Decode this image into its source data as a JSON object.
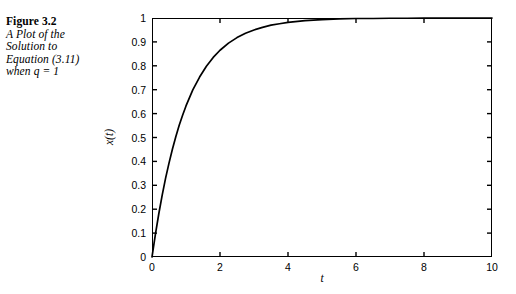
{
  "caption": {
    "figure_label": "Figure 3.2",
    "lines": [
      "A Plot of the",
      "Solution to",
      "Equation (3.11)",
      "when q = 1"
    ]
  },
  "chart_data": {
    "type": "line",
    "title": "",
    "xlabel": "t",
    "ylabel": "x(t)",
    "xlim": [
      0,
      10
    ],
    "ylim": [
      0,
      1
    ],
    "xticks": [
      0,
      2,
      4,
      6,
      8,
      10
    ],
    "xtick_labels": [
      "0",
      "2",
      "4",
      "6",
      "8",
      "10"
    ],
    "yticks": [
      0,
      0.1,
      0.2,
      0.3,
      0.4,
      0.5,
      0.6,
      0.7,
      0.8,
      0.9,
      1
    ],
    "ytick_labels": [
      "0",
      "0.1",
      "0.2",
      "0.3",
      "0.4",
      "0.5",
      "0.6",
      "0.7",
      "0.8",
      "0.9",
      "1"
    ],
    "grid": false,
    "legend": null,
    "series": [
      {
        "name": "x(t) = 1 - e^(-t)",
        "color": "#000000",
        "x": [
          0.0,
          0.1,
          0.2,
          0.3,
          0.4,
          0.5,
          0.6,
          0.7,
          0.8,
          0.9,
          1.0,
          1.2,
          1.4,
          1.6,
          1.8,
          2.0,
          2.25,
          2.5,
          2.75,
          3.0,
          3.25,
          3.5,
          3.75,
          4.0,
          4.5,
          5.0,
          5.5,
          6.0,
          6.5,
          7.0,
          7.5,
          8.0,
          8.5,
          9.0,
          9.5,
          10.0
        ],
        "y": [
          0.0,
          0.095,
          0.181,
          0.259,
          0.33,
          0.393,
          0.451,
          0.503,
          0.551,
          0.593,
          0.632,
          0.699,
          0.753,
          0.798,
          0.835,
          0.865,
          0.895,
          0.918,
          0.936,
          0.95,
          0.961,
          0.97,
          0.976,
          0.982,
          0.989,
          0.993,
          0.996,
          0.998,
          0.998,
          0.999,
          0.999,
          1.0,
          1.0,
          1.0,
          1.0,
          1.0
        ]
      }
    ]
  },
  "style": {
    "axis_color": "#000000",
    "background": "#ffffff",
    "line_color": "#000000"
  }
}
